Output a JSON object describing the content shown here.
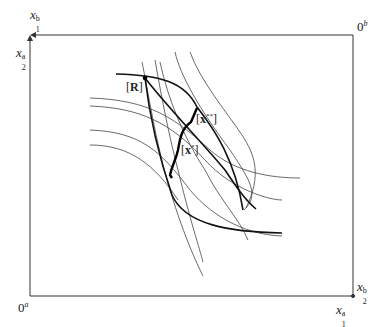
{
  "diagram": {
    "type": "edgeworth-box",
    "box": {
      "left": 30,
      "top": 35,
      "right": 353,
      "bottom": 296,
      "stroke": "#333333"
    },
    "origins": {
      "a": {
        "label": "0",
        "sup": "a"
      },
      "b": {
        "label": "0",
        "sup": "b"
      }
    },
    "axes": {
      "top_left_x": {
        "base": "x",
        "sup": "b",
        "sub": "1"
      },
      "top_left_y": {
        "base": "x",
        "sup": "a",
        "sub": "2"
      },
      "bottom_right_x": {
        "base": "x",
        "sup": "a",
        "sub": "1"
      },
      "bottom_right_y": {
        "base": "x",
        "sup": "b",
        "sub": "2"
      }
    },
    "points": {
      "R": {
        "open": "[",
        "label": "R",
        "close": "]"
      },
      "x_star": {
        "open": "[",
        "label": "x",
        "sup": "*",
        "close": "]"
      },
      "x_double_star": {
        "open": "[",
        "label": "x",
        "sup": "**",
        "close": "]"
      }
    },
    "colors": {
      "line": "#2a2a2a",
      "thin": "#444444",
      "bold": "#111111"
    }
  }
}
